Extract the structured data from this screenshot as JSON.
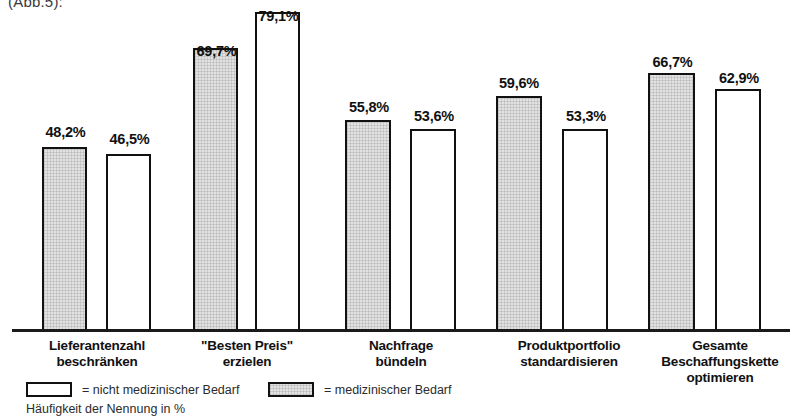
{
  "caption_fragment": "(Abb.5):",
  "chart_data": {
    "type": "bar",
    "title": "",
    "subtitle": "",
    "xlabel": "",
    "ylabel": "Häufigkeit der Nennung in %",
    "ylim": [
      0,
      100
    ],
    "grid": false,
    "legend_position": "bottom-left",
    "value_suffix": "%",
    "decimal_separator": ",",
    "categories": [
      "Lieferantenzahl\nbeschränken",
      "\"Besten Preis\"\nerzielen",
      "Nachfrage\nbündeln",
      "Produktportfolio\nstandardisieren",
      "Gesamte\nBeschaffungskette\noptimieren"
    ],
    "category_lines": [
      [
        "Lieferantenzahl",
        "beschränken"
      ],
      [
        "\"Besten Preis\"",
        "erzielen"
      ],
      [
        "Nachfrage",
        "bündeln"
      ],
      [
        "Produktportfolio",
        "standardisieren"
      ],
      [
        "Gesamte",
        "Beschaffungskette",
        "optimieren"
      ]
    ],
    "series": [
      {
        "name": "medizinischer Bedarf",
        "fill": "#e2e2e2",
        "values": [
          48.2,
          69.7,
          55.8,
          59.6,
          66.7
        ],
        "labels": [
          "48,2%",
          "69,7%",
          "55,8%",
          "59,6%",
          "66,7%"
        ]
      },
      {
        "name": "nicht medizinischer Bedarf",
        "fill": "#ffffff",
        "values": [
          46.5,
          79.1,
          53.6,
          53.3,
          62.9
        ],
        "labels": [
          "46,5%",
          "79,1%",
          "53,6%",
          "53,3%",
          "62,9%"
        ]
      }
    ]
  },
  "legend": {
    "entries": [
      {
        "swatch": "white",
        "label": "= nicht medizinischer Bedarf"
      },
      {
        "swatch": "gray",
        "label": "= medizinischer Bedarf"
      }
    ],
    "axis_note": "Häufigkeit der Nennung in %"
  },
  "bars": [
    {
      "value_label": "48,2%",
      "style": "gray",
      "x": 42,
      "width": 45,
      "height": 185,
      "label_x": 38,
      "label_y": 124
    },
    {
      "value_label": "46,5%",
      "style": "white",
      "x": 106,
      "width": 45,
      "height": 178,
      "label_x": 102,
      "label_y": 131
    },
    {
      "value_label": "69,7%",
      "style": "gray",
      "x": 193,
      "width": 45,
      "height": 284,
      "label_x": 189,
      "label_y": 43
    },
    {
      "value_label": "79,1%",
      "style": "white",
      "x": 255,
      "width": 45,
      "height": 320,
      "label_x": 251,
      "label_y": 8
    },
    {
      "value_label": "55,8%",
      "style": "gray",
      "x": 345,
      "width": 46,
      "height": 212,
      "label_x": 341,
      "label_y": 99
    },
    {
      "value_label": "53,6%",
      "style": "white",
      "x": 410,
      "width": 46,
      "height": 203,
      "label_x": 406,
      "label_y": 108
    },
    {
      "value_label": "59,6%",
      "style": "gray",
      "x": 496,
      "width": 46,
      "height": 236,
      "label_x": 491,
      "label_y": 75
    },
    {
      "value_label": "53,3%",
      "style": "white",
      "x": 562,
      "width": 46,
      "height": 203,
      "label_x": 558,
      "label_y": 108
    },
    {
      "value_label": "66,7%",
      "style": "gray",
      "x": 648,
      "width": 47,
      "height": 259,
      "label_x": 644,
      "label_y": 54
    },
    {
      "value_label": "62,9%",
      "style": "white",
      "x": 715,
      "width": 46,
      "height": 243,
      "label_x": 711,
      "label_y": 70
    }
  ],
  "category_positions": [
    {
      "left": 0,
      "width": 194
    },
    {
      "left": 177,
      "width": 140
    },
    {
      "left": 330,
      "width": 142
    },
    {
      "left": 470,
      "width": 198
    },
    {
      "left": 640,
      "width": 160
    }
  ]
}
